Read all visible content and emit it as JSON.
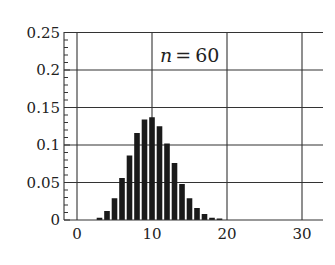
{
  "chart_data": {
    "type": "bar",
    "title": "",
    "annotation": {
      "var": "n",
      "eq": "=",
      "value": "60"
    },
    "xlabel": "",
    "ylabel": "",
    "xlim": [
      -1.7,
      32.7
    ],
    "ylim": [
      0,
      0.25
    ],
    "x_ticks": [
      0,
      10,
      20,
      30
    ],
    "x_tick_labels": [
      "0",
      "10",
      "20",
      "30"
    ],
    "y_ticks": [
      0,
      0.05,
      0.1,
      0.15,
      0.2,
      0.25
    ],
    "y_tick_labels": [
      "0",
      "0.05",
      "0.1",
      "0.15",
      "0.2",
      "0.25"
    ],
    "grid": true,
    "legend": null,
    "x": [
      3,
      4,
      5,
      6,
      7,
      8,
      9,
      10,
      11,
      12,
      13,
      14,
      15,
      16,
      17,
      18,
      19
    ],
    "values": [
      0.003,
      0.012,
      0.029,
      0.056,
      0.086,
      0.116,
      0.134,
      0.137,
      0.125,
      0.102,
      0.076,
      0.048,
      0.029,
      0.016,
      0.008,
      0.003,
      0.002
    ],
    "bar_color": "#1a1a1a"
  }
}
